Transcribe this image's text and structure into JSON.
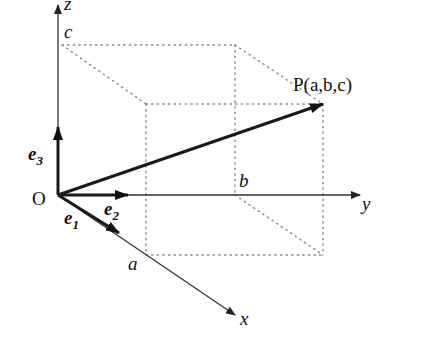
{
  "diagram": {
    "origin_label": "O",
    "axes": {
      "x": {
        "label": "x",
        "tick_label": "a"
      },
      "y": {
        "label": "y",
        "tick_label": "b"
      },
      "z": {
        "label": "z",
        "tick_label": "c"
      }
    },
    "basis_vectors": [
      {
        "name": "e",
        "subscript": "1",
        "direction": "x"
      },
      {
        "name": "e",
        "subscript": "2",
        "direction": "y"
      },
      {
        "name": "e",
        "subscript": "3",
        "direction": "z"
      }
    ],
    "point": {
      "label": "P(a,b,c)"
    },
    "colors": {
      "axis": "#333333",
      "vector": "#1a1a1a",
      "box": "#8a8a8a"
    }
  }
}
